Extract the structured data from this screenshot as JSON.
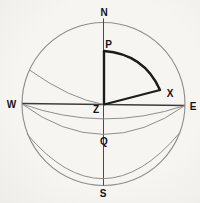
{
  "figure": {
    "type": "celestial-sphere-diagram",
    "colors": {
      "paper": "#f4f3f0",
      "thin_stroke": "#8f8d8a",
      "medium_stroke": "#4c4a48",
      "bold_stroke": "#1c1c1c",
      "label_ink": "#141414"
    },
    "points": {
      "N": {
        "label": "N",
        "role": "north-point"
      },
      "S": {
        "label": "S",
        "role": "south-point"
      },
      "W": {
        "label": "W",
        "role": "west-point"
      },
      "E": {
        "label": "E",
        "role": "east-point"
      },
      "P": {
        "label": "P",
        "role": "celestial-pole"
      },
      "Z": {
        "label": "Z",
        "role": "zenith-center"
      },
      "X": {
        "label": "X",
        "role": "celestial-body"
      },
      "Q": {
        "label": "Q",
        "role": "equator-meridian-point"
      }
    },
    "curves": {
      "outer_circle": "celestial sphere / horizon circle",
      "vertical_diameter": "N–Z–Q–S meridian line",
      "horizontal_diameter": "W–Z–E line",
      "sag_arc_upper": "parallel arc crossing meridian just below Z",
      "sag_arc_equator": "celestial equator arc through Q",
      "sag_arc_lower": "deep parallel arc near S",
      "upper_left_arc": "arc from sphere edge to Z",
      "triangle": "bold spherical triangle P–Z–X"
    }
  }
}
